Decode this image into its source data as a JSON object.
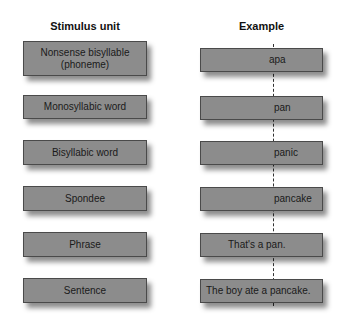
{
  "headers": {
    "left": "Stimulus unit",
    "right": "Example"
  },
  "rows": [
    {
      "unit": "Nonsense bisyllable (phoneme)",
      "unit_line1": "Nonsense bisyllable",
      "unit_line2": "(phoneme)",
      "example": "apa"
    },
    {
      "unit": "Monosyllabic word",
      "example": "pan"
    },
    {
      "unit": "Bisyllabic word",
      "example": "panic"
    },
    {
      "unit": "Spondee",
      "example": "pancake"
    },
    {
      "unit": "Phrase",
      "example": "That's a pan."
    },
    {
      "unit": "Sentence",
      "example": "The boy ate a pancake."
    }
  ],
  "colors": {
    "box_fill": "#8c8c8c",
    "box_border": "#4a4a4a",
    "text": "#1a1a1a"
  }
}
